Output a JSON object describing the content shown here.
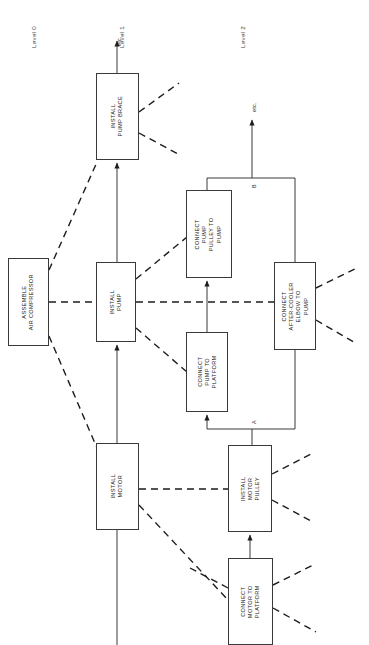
{
  "diagram": {
    "levels": [
      {
        "id": "level-0",
        "label": "Level 0",
        "x": 30,
        "y": 48
      },
      {
        "id": "level-1",
        "label": "Level 1",
        "x": 118,
        "y": 48
      },
      {
        "id": "level-2",
        "label": "Level 2",
        "x": 239,
        "y": 48
      }
    ],
    "nodes": [
      {
        "id": "assemble-air-compressor",
        "lines": [
          "ASSEMBLE",
          "AIR COMPRESSOR"
        ],
        "x": 8,
        "y": 258,
        "w": 41,
        "h": 88
      },
      {
        "id": "install-pump-brace",
        "lines": [
          "INSTALL",
          "PUMP BRACE"
        ],
        "x": 96,
        "y": 73,
        "w": 43,
        "h": 87
      },
      {
        "id": "install-pump",
        "lines": [
          "INSTALL",
          "PUMP"
        ],
        "x": 96,
        "y": 262,
        "w": 40,
        "h": 80
      },
      {
        "id": "install-motor",
        "lines": [
          "INSTALL",
          "MOTOR"
        ],
        "x": 96,
        "y": 443,
        "w": 43,
        "h": 87
      },
      {
        "id": "connect-pump-pulley-to-pump",
        "lines": [
          "CONNECT",
          "PUMP",
          "PULLEY TO",
          "PUMP"
        ],
        "x": 186,
        "y": 190,
        "w": 46,
        "h": 88
      },
      {
        "id": "connect-pump-to-platform",
        "lines": [
          "CONNECT",
          "PUMP TO",
          "PLATFORM"
        ],
        "x": 186,
        "y": 332,
        "w": 42,
        "h": 80
      },
      {
        "id": "connect-after-cooler-elbow-to-pump",
        "lines": [
          "CONNECT",
          "AFTER-COOLER",
          "ELBOW TO",
          "PUMP"
        ],
        "x": 274,
        "y": 262,
        "w": 42,
        "h": 88
      },
      {
        "id": "install-motor-pulley",
        "lines": [
          "INSTALL",
          "MOTOR",
          "PULLEY"
        ],
        "x": 228,
        "y": 445,
        "w": 44,
        "h": 87
      },
      {
        "id": "connect-motor-to-platform",
        "lines": [
          "CONNECT",
          "MOTOR TO",
          "PLATFORM"
        ],
        "x": 228,
        "y": 558,
        "w": 45,
        "h": 87
      }
    ],
    "connector_labels": [
      {
        "id": "junction-a",
        "label": "A",
        "x": 252,
        "y": 423
      },
      {
        "id": "junction-b",
        "label": "B",
        "x": 252,
        "y": 188
      },
      {
        "id": "etc-level-1",
        "label": "etc.",
        "x": 118,
        "y": 48
      },
      {
        "id": "etc-level-2",
        "label": "etc.",
        "x": 252,
        "y": 108
      }
    ],
    "colors": {
      "stroke": "#3a3a3a",
      "dashed_stroke": "#1d1d1d",
      "text": "#222222",
      "background": "#ffffff"
    }
  }
}
